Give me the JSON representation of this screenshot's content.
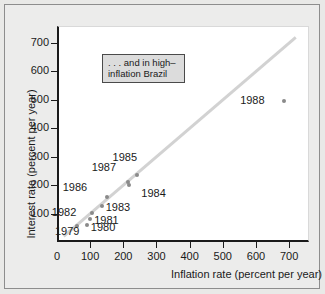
{
  "chart_data": {
    "type": "scatter",
    "title": "",
    "xlabel": "Inflation rate (percent per year)",
    "ylabel": "Interest rate (percent per year)",
    "xlim": [
      0,
      760
    ],
    "ylim": [
      0,
      760
    ],
    "xticks": [
      0,
      100,
      200,
      300,
      400,
      500,
      600,
      700
    ],
    "xticklabels": [
      "0",
      "100",
      "200",
      "300",
      "400",
      "500",
      "600",
      "700"
    ],
    "yticks": [
      100,
      200,
      300,
      400,
      500,
      600,
      700
    ],
    "yticklabels": [
      "100",
      "200",
      "300",
      "400",
      "500",
      "600",
      "700"
    ],
    "grid": false,
    "legend": "none",
    "annotations": [
      {
        "name": "callout-box",
        "line1": ". . . and in high–",
        "line2": "inflation Brazil"
      }
    ],
    "reference_line": {
      "name": "45-degree-line",
      "from": [
        20,
        20
      ],
      "to": [
        720,
        720
      ],
      "color": "#d2d2d2"
    },
    "point_color": "#8a8a8a",
    "points": [
      {
        "label": "1979",
        "x": 60,
        "y": 55,
        "label_dx": -22,
        "label_dy": 6
      },
      {
        "label": "1980",
        "x": 90,
        "y": 60,
        "label_dx": 4,
        "label_dy": 3
      },
      {
        "label": "1981",
        "x": 100,
        "y": 80,
        "label_dx": 4,
        "label_dy": 2
      },
      {
        "label": "1982",
        "x": 105,
        "y": 103,
        "label_dx": -40,
        "label_dy": 0
      },
      {
        "label": "1983",
        "x": 135,
        "y": 128,
        "label_dx": 4,
        "label_dy": 2
      },
      {
        "label": "1986",
        "x": 150,
        "y": 157,
        "label_dx": -44,
        "label_dy": -9
      },
      {
        "label": "1987",
        "x": 213,
        "y": 210,
        "label_dx": -36,
        "label_dy": -14
      },
      {
        "label": "1984",
        "x": 218,
        "y": 199,
        "label_dx": 12,
        "label_dy": 9
      },
      {
        "label": "1985",
        "x": 240,
        "y": 237,
        "label_dx": -24,
        "label_dy": -17
      },
      {
        "label": "1988",
        "x": 685,
        "y": 497,
        "label_dx": -44,
        "label_dy": 0
      }
    ]
  }
}
